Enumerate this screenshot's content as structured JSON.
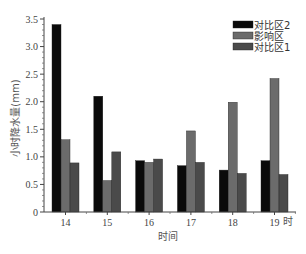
{
  "chart_data": {
    "type": "bar",
    "title": "",
    "xlabel": "时间",
    "xlabel_unit_suffix": "时",
    "ylabel": "小时降水量(mm)",
    "ylim": [
      0,
      3.5
    ],
    "yticks": [
      0,
      0.5,
      1.0,
      1.5,
      2.0,
      2.5,
      3.0,
      3.5
    ],
    "ytick_labels": [
      "0",
      "0.5",
      "1.0",
      "1.5",
      "2.0",
      "2.5",
      "3.0",
      "3.5"
    ],
    "categories": [
      "14",
      "15",
      "16",
      "17",
      "18",
      "19"
    ],
    "grid": false,
    "legend_position": "top-right",
    "series": [
      {
        "name": "对比区2",
        "color": "#0a0a0a",
        "values": [
          3.4,
          2.1,
          0.93,
          0.84,
          0.76,
          0.93
        ]
      },
      {
        "name": "影响区",
        "color": "#6b6b6b",
        "values": [
          1.31,
          0.57,
          0.9,
          1.47,
          1.99,
          2.42
        ]
      },
      {
        "name": "对比区1",
        "color": "#4a4a4a",
        "values": [
          0.89,
          1.09,
          0.96,
          0.9,
          0.7,
          0.68
        ]
      }
    ]
  }
}
